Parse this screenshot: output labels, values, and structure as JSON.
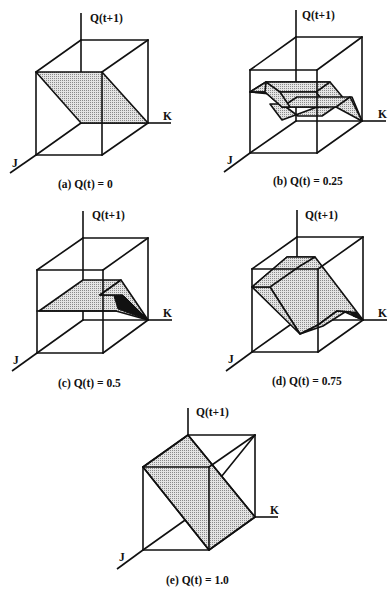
{
  "figure": {
    "axis_labels": {
      "vertical": "Q(t+1)",
      "horizontal": "K",
      "depth": "J"
    },
    "panels": [
      {
        "id": "a",
        "caption": "(a) Q(t) = 0",
        "qt": 0
      },
      {
        "id": "b",
        "caption": "(b) Q(t) = 0.25",
        "qt": 0.25
      },
      {
        "id": "c",
        "caption": "(c) Q(t) = 0.5",
        "qt": 0.5
      },
      {
        "id": "d",
        "caption": "(d) Q(t) = 0.75",
        "qt": 0.75
      },
      {
        "id": "e",
        "caption": "(e) Q(t) = 1.0",
        "qt": 1.0
      }
    ],
    "colors": {
      "line": "#111111",
      "surface_fill": "#c8c8c8",
      "background": "#ffffff"
    }
  }
}
